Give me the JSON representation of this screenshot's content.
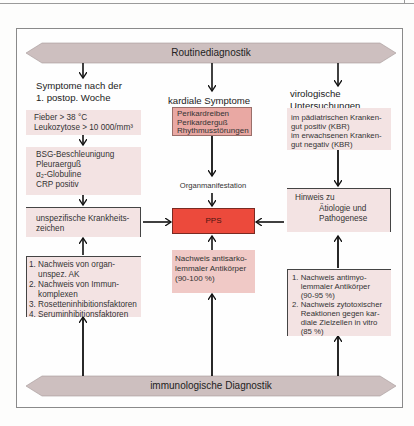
{
  "banners": {
    "top": "Routinediagnostik",
    "bottom": "immunologische Diagnostik"
  },
  "left_column": {
    "heading": [
      "Symptome nach der",
      "1. postop. Woche"
    ],
    "box1": [
      "Fieber > 38 °C",
      "Leukozytose > 10 000/mm³"
    ],
    "box2": [
      "BSG-Beschleunigung",
      "Pleuraerguß",
      "α₂-Globuline",
      "CRP positiv"
    ],
    "box3": [
      "unspezifische Krankheits-",
      "zeichen"
    ],
    "box4": [
      "1. Nachweis von organ-",
      "    unspez. AK",
      "2. Nachweis von Immun-",
      "    komplexen",
      "3. Rosetteninhibitionsfaktoren",
      "4. Seruminhibitionsfaktoren"
    ]
  },
  "center_column": {
    "heading": "kardiale Symptome",
    "box1": [
      "Perikardreiben",
      "Perikarderguß",
      "Rhythmusstörungen"
    ],
    "organ_label": "Organmanifestation",
    "pps": "PPS",
    "box2": [
      "Nachweis antisarko-",
      "lemmaler Antikörper",
      "(90-100 %)"
    ]
  },
  "right_column": {
    "heading": [
      "virologische",
      "Untersuchungen"
    ],
    "box1": [
      "im pädiatrischen Kranken-",
      "gut positiv (KBR)",
      "im erwachsenen Kranken-",
      "gut negativ (KBR)"
    ],
    "box2_title": "Hinweis zu",
    "box2": [
      "Ätiologie und",
      "Pathogenese"
    ],
    "box3": [
      "1. Nachweis antimyo-",
      "    lemmaler Antikörper",
      "    (90-95 %)",
      "2. Nachweis zytotoxischer",
      "    Reaktionen gegen kar-",
      "    diale Zielzellen in vitro",
      "    (85 %)"
    ]
  },
  "colors": {
    "banner": "#cdbfbf",
    "pale_box": "#f3e3e3",
    "salmon_box": "#e9a8a3",
    "pink_box": "#f0c9c6",
    "pps_box": "#ec4a3c"
  }
}
